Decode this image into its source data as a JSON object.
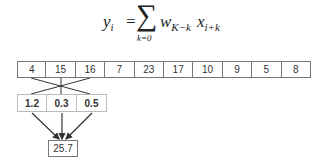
{
  "formula": {
    "lhs": "y",
    "lhs_sub": "i",
    "equals": "=",
    "sigma": "∑",
    "lower_limit": "k=0",
    "upper_limit": "K−1",
    "w": "w",
    "w_sub": "K−k",
    "x": "x",
    "x_sub": "i+k"
  },
  "input": [
    "4",
    "15",
    "16",
    "7",
    "23",
    "17",
    "10",
    "9",
    "5",
    "8"
  ],
  "kernel": [
    "1.2",
    "0.3",
    "0.5"
  ],
  "output": [
    "25.7"
  ],
  "colors": {
    "border": "#777777",
    "kernel_border": "#bbbbbb",
    "line": "#333333"
  }
}
